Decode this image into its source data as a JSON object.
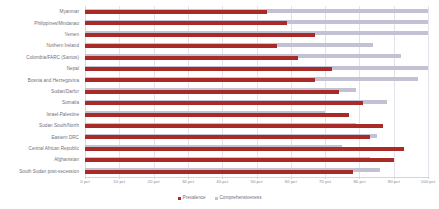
{
  "chart_data": {
    "type": "bar",
    "orientation": "horizontal",
    "title": "",
    "subtitle": "",
    "xlabel": "",
    "ylabel": "",
    "xlim": [
      0,
      100
    ],
    "grid": true,
    "legend_position": "bottom",
    "xticks": [
      0,
      10,
      20,
      30,
      40,
      50,
      60,
      70,
      80,
      90,
      100
    ],
    "xtick_labels": [
      "0 pct",
      "10 pct",
      "20 pct",
      "30 pct",
      "40 pct",
      "50 pct",
      "60 pct",
      "70 pct",
      "80 pct",
      "90 pct",
      "100 pct"
    ],
    "categories": [
      "Myanmar",
      "Philippines/Mindanao",
      "Yemen",
      "Nothern Ireland",
      "Colombia/FARC (Santos)",
      "Nepal",
      "Bosnia and Herzegovina",
      "Sudan/Darfur",
      "Somalia",
      "Israel-Palestine",
      "Sudan South/North",
      "Eastern DRC",
      "Central African Republic",
      "Afghanistan",
      "South Sudan post-secession"
    ],
    "series": [
      {
        "name": "Prevalence",
        "color": "#a82b27",
        "values": [
          53,
          59,
          67,
          56,
          62,
          72,
          67,
          74,
          81,
          77,
          87,
          83,
          93,
          90,
          78
        ]
      },
      {
        "name": "Comprehensiveness",
        "color": "#c3c1d4",
        "values": [
          100,
          100,
          100,
          84,
          92,
          100,
          97,
          79,
          88,
          70,
          79,
          85,
          75,
          83,
          86
        ]
      }
    ]
  },
  "legend": {
    "items": [
      {
        "label": "Prevalence",
        "color": "#a82b27"
      },
      {
        "label": "Comprehensiveness",
        "color": "#c3c1d4"
      }
    ]
  }
}
